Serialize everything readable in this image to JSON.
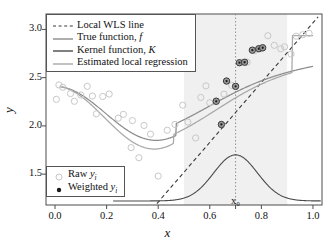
{
  "chart_data": {
    "type": "scatter",
    "title": "",
    "xlabel": "x",
    "ylabel": "y",
    "xlim": [
      -0.035,
      1.035
    ],
    "ylim": [
      1.18,
      3.16
    ],
    "xticks": [
      "0.0",
      "0.2",
      "0.4",
      "0.6",
      "0.8",
      "1.0"
    ],
    "xtick_values": [
      0.0,
      0.2,
      0.4,
      0.6,
      0.8,
      1.0
    ],
    "yticks": [
      "1.5",
      "2.0",
      "2.5",
      "3.0"
    ],
    "ytick_values": [
      1.5,
      2.0,
      2.5,
      3.0
    ],
    "grid": false,
    "x0_label": "x₀",
    "x0_value": 0.7,
    "bandwidth_region": [
      0.5,
      0.9
    ],
    "band_color": "#f0f0f0",
    "series": [
      {
        "name": "Raw yᵢ",
        "type": "scatter",
        "marker": "open-circle",
        "color": "#c8c8c8",
        "points": [
          [
            0.005,
            2.275
          ],
          [
            0.015,
            2.425
          ],
          [
            0.03,
            2.4
          ],
          [
            0.048,
            2.615
          ],
          [
            0.06,
            2.335
          ],
          [
            0.075,
            2.255
          ],
          [
            0.1,
            2.32
          ],
          [
            0.125,
            2.41
          ],
          [
            0.145,
            2.31
          ],
          [
            0.16,
            2.125
          ],
          [
            0.185,
            2.305
          ],
          [
            0.21,
            2.33
          ],
          [
            0.245,
            2.08
          ],
          [
            0.265,
            2.12
          ],
          [
            0.295,
            1.775
          ],
          [
            0.3,
            2.055
          ],
          [
            0.325,
            1.67
          ],
          [
            0.345,
            2.005
          ],
          [
            0.37,
            1.915
          ],
          [
            0.4,
            1.48
          ],
          [
            0.435,
            1.955
          ],
          [
            0.465,
            2.015
          ],
          [
            0.495,
            2.215
          ],
          [
            0.515,
            2.04
          ],
          [
            0.545,
            1.875
          ],
          [
            0.565,
            2.295
          ],
          [
            0.585,
            2.415
          ],
          [
            0.6,
            2.24
          ],
          [
            0.625,
            2.26
          ],
          [
            0.655,
            2.33
          ],
          [
            0.685,
            2.42
          ],
          [
            0.7,
            2.41
          ],
          [
            0.745,
            2.66
          ],
          [
            0.775,
            2.78
          ],
          [
            0.8,
            2.8
          ],
          [
            0.825,
            2.935
          ],
          [
            0.85,
            2.835
          ],
          [
            0.875,
            2.8
          ],
          [
            0.89,
            2.82
          ],
          [
            0.915,
            2.745
          ],
          [
            0.935,
            2.93
          ],
          [
            0.96,
            2.945
          ],
          [
            0.985,
            2.96
          ]
        ]
      },
      {
        "name": "Weighted yᵢ",
        "type": "scatter",
        "marker": "filled-circle",
        "color": "#4a4a4a",
        "points": [
          [
            0.625,
            2.255
          ],
          [
            0.645,
            2.015
          ],
          [
            0.665,
            2.465
          ],
          [
            0.7,
            2.41
          ],
          [
            0.715,
            2.655
          ],
          [
            0.735,
            2.66
          ],
          [
            0.765,
            2.785
          ],
          [
            0.79,
            2.8
          ],
          [
            0.805,
            2.81
          ]
        ]
      },
      {
        "name": "Local WLS line",
        "type": "line",
        "style": "dashed",
        "color": "#3a3a3a",
        "x_range": [
          0.395,
          1.02
        ],
        "y_range": [
          1.195,
          3.13
        ]
      },
      {
        "name": "True function, f",
        "type": "line",
        "style": "solid",
        "color": "#8c8c8c",
        "description": "smooth wave: ~2.41 at x=0, dip to ~1.85 near x=0.38, rising to ~2.96 at x=1.0"
      },
      {
        "name": "Kernel function, K",
        "type": "line",
        "style": "solid",
        "color": "#4a4a4a",
        "description": "gaussian bump centered at x0=0.7, baseline y≈1.22, peak y≈1.70, sd≈0.085"
      },
      {
        "name": "Estimated local regression",
        "type": "line",
        "style": "solid",
        "color": "#a8a8a8",
        "description": "smooth fit: ~2.40 at x=0, dip to ~1.775 near x=0.385, rising to ~2.94 at x=0.93 then flat"
      }
    ]
  },
  "legend_top": {
    "name": "legend-lines",
    "items": [
      {
        "label": "Local WLS line",
        "style": "dashed",
        "color": "#3a3a3a"
      },
      {
        "label": "True function, f",
        "style": "solid",
        "color": "#8c8c8c",
        "italic_tail": "f"
      },
      {
        "label": "Kernel function, K",
        "style": "solid",
        "color": "#4a4a4a",
        "italic_tail": "K"
      },
      {
        "label": "Estimated local regression",
        "style": "solid",
        "color": "#a8a8a8"
      }
    ]
  },
  "legend_bottom": {
    "name": "legend-markers",
    "items": [
      {
        "label": "Raw",
        "sym": "open-circle",
        "var": "y",
        "sub": "i"
      },
      {
        "label": "Weighted",
        "sym": "filled-circle",
        "var": "y",
        "sub": "i"
      }
    ]
  },
  "axes": {
    "x_title": "x",
    "y_title": "y"
  }
}
